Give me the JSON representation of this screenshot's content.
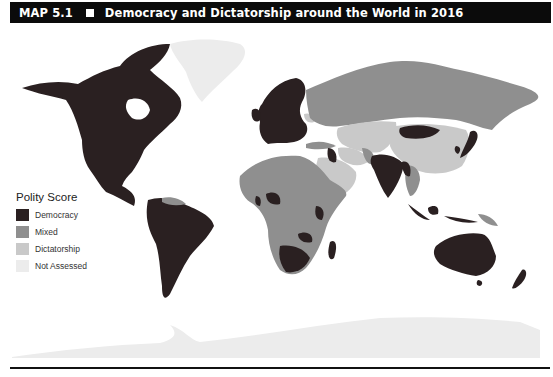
{
  "header": {
    "map_number": "MAP 5.1",
    "separator_glyph": "square",
    "title": "Democracy and Dictatorship around the World in 2016"
  },
  "legend": {
    "title": "Polity Score",
    "items": [
      {
        "label": "Democracy",
        "color": "#2a2021"
      },
      {
        "label": "Mixed",
        "color": "#8f8f8f"
      },
      {
        "label": "Dictatorship",
        "color": "#c9c9c9"
      },
      {
        "label": "Not Assessed",
        "color": "#ececec"
      }
    ]
  },
  "map": {
    "projection": "world",
    "regions": [
      {
        "name": "North America (USA, Canada, Mexico)",
        "category": "Democracy"
      },
      {
        "name": "Greenland",
        "category": "Not Assessed"
      },
      {
        "name": "Central America",
        "category": "Democracy"
      },
      {
        "name": "South America (most)",
        "category": "Democracy"
      },
      {
        "name": "Venezuela",
        "category": "Mixed"
      },
      {
        "name": "Western & Northern Europe",
        "category": "Democracy"
      },
      {
        "name": "Russia",
        "category": "Mixed"
      },
      {
        "name": "Belarus",
        "category": "Dictatorship"
      },
      {
        "name": "Turkey",
        "category": "Mixed"
      },
      {
        "name": "Central Asia",
        "category": "Dictatorship"
      },
      {
        "name": "China",
        "category": "Dictatorship"
      },
      {
        "name": "Mongolia",
        "category": "Democracy"
      },
      {
        "name": "India",
        "category": "Democracy"
      },
      {
        "name": "Pakistan",
        "category": "Mixed"
      },
      {
        "name": "Saudi Arabia / Arabian Peninsula",
        "category": "Dictatorship"
      },
      {
        "name": "Iraq",
        "category": "Democracy"
      },
      {
        "name": "Japan",
        "category": "Democracy"
      },
      {
        "name": "South Korea",
        "category": "Democracy"
      },
      {
        "name": "Southeast Asia (Thailand, Cambodia)",
        "category": "Mixed"
      },
      {
        "name": "Indonesia",
        "category": "Democracy"
      },
      {
        "name": "Papua New Guinea",
        "category": "Mixed"
      },
      {
        "name": "North Africa",
        "category": "Mixed"
      },
      {
        "name": "Sub-Saharan Africa (most)",
        "category": "Mixed"
      },
      {
        "name": "Nigeria",
        "category": "Democracy"
      },
      {
        "name": "Kenya",
        "category": "Democracy"
      },
      {
        "name": "Southern Africa (South Africa, Namibia, Botswana)",
        "category": "Democracy"
      },
      {
        "name": "Zambia",
        "category": "Democracy"
      },
      {
        "name": "Madagascar",
        "category": "Democracy"
      },
      {
        "name": "Australia",
        "category": "Democracy"
      },
      {
        "name": "New Zealand",
        "category": "Democracy"
      },
      {
        "name": "Antarctica",
        "category": "Not Assessed"
      }
    ]
  }
}
